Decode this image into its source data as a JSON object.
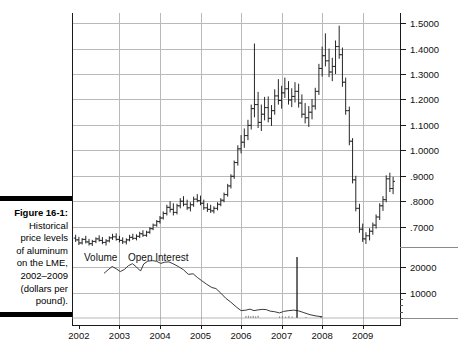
{
  "caption": {
    "figure_label": "Figure 16-1:",
    "lines": [
      "Historical",
      "price levels",
      "of aluminum",
      "on the LME,",
      "2002–2009",
      "(dollars per",
      "pound)."
    ]
  },
  "series_labels": {
    "volume": "Volume",
    "open_interest": "Open Interest"
  },
  "colors": {
    "bars": "#1a1a1a",
    "grid": "#b9b9b9",
    "axis": "#1a1a1a",
    "line": "#3a3a3a"
  },
  "chart_data": {
    "type": "line",
    "subtype": "ohlc-bar-chart-with-volume-panel",
    "xlabel": "",
    "ylabel": "dollars per pound",
    "grid": true,
    "legend_position": "inline-above-volume-panel",
    "price_panel": {
      "ylim": [
        0.62,
        1.54
      ],
      "yticks": [
        1.5,
        1.4,
        1.3,
        1.2,
        1.1,
        1.0,
        0.9,
        0.8,
        0.7
      ],
      "ytick_labels": [
        "1.5000",
        "1.4000",
        "1.3000",
        "1.2000",
        "1.1000",
        "1.0000",
        ".9000",
        ".8000",
        ".7000"
      ]
    },
    "volume_panel": {
      "ylim": [
        0,
        26000
      ],
      "yticks": [
        20000,
        10000
      ],
      "ytick_labels": [
        "20000",
        "10000"
      ]
    },
    "xticks": [
      2002,
      2003,
      2004,
      2005,
      2006,
      2007,
      2008,
      2009
    ],
    "xtick_labels": [
      "2002",
      "2003",
      "2004",
      "2005",
      "2006",
      "2007",
      "2008",
      "2009"
    ],
    "xlim": [
      2001.83,
      2009.92
    ],
    "ohlc": [
      {
        "t": 2001.92,
        "o": 0.655,
        "h": 0.668,
        "l": 0.64,
        "c": 0.648
      },
      {
        "t": 2002.0,
        "o": 0.648,
        "h": 0.66,
        "l": 0.628,
        "c": 0.636
      },
      {
        "t": 2002.08,
        "o": 0.636,
        "h": 0.655,
        "l": 0.63,
        "c": 0.65
      },
      {
        "t": 2002.17,
        "o": 0.65,
        "h": 0.664,
        "l": 0.634,
        "c": 0.64
      },
      {
        "t": 2002.25,
        "o": 0.64,
        "h": 0.652,
        "l": 0.626,
        "c": 0.633
      },
      {
        "t": 2002.33,
        "o": 0.633,
        "h": 0.648,
        "l": 0.624,
        "c": 0.642
      },
      {
        "t": 2002.42,
        "o": 0.642,
        "h": 0.658,
        "l": 0.635,
        "c": 0.652
      },
      {
        "t": 2002.5,
        "o": 0.652,
        "h": 0.666,
        "l": 0.641,
        "c": 0.646
      },
      {
        "t": 2002.58,
        "o": 0.646,
        "h": 0.659,
        "l": 0.631,
        "c": 0.638
      },
      {
        "t": 2002.67,
        "o": 0.638,
        "h": 0.651,
        "l": 0.626,
        "c": 0.644
      },
      {
        "t": 2002.75,
        "o": 0.644,
        "h": 0.662,
        "l": 0.638,
        "c": 0.656
      },
      {
        "t": 2002.83,
        "o": 0.656,
        "h": 0.672,
        "l": 0.648,
        "c": 0.66
      },
      {
        "t": 2002.92,
        "o": 0.66,
        "h": 0.674,
        "l": 0.645,
        "c": 0.65
      },
      {
        "t": 2003.0,
        "o": 0.65,
        "h": 0.664,
        "l": 0.638,
        "c": 0.646
      },
      {
        "t": 2003.08,
        "o": 0.646,
        "h": 0.658,
        "l": 0.632,
        "c": 0.64
      },
      {
        "t": 2003.17,
        "o": 0.64,
        "h": 0.654,
        "l": 0.63,
        "c": 0.648
      },
      {
        "t": 2003.25,
        "o": 0.648,
        "h": 0.668,
        "l": 0.642,
        "c": 0.658
      },
      {
        "t": 2003.33,
        "o": 0.658,
        "h": 0.672,
        "l": 0.648,
        "c": 0.654
      },
      {
        "t": 2003.42,
        "o": 0.654,
        "h": 0.67,
        "l": 0.646,
        "c": 0.662
      },
      {
        "t": 2003.5,
        "o": 0.662,
        "h": 0.68,
        "l": 0.655,
        "c": 0.672
      },
      {
        "t": 2003.58,
        "o": 0.672,
        "h": 0.686,
        "l": 0.66,
        "c": 0.666
      },
      {
        "t": 2003.67,
        "o": 0.666,
        "h": 0.684,
        "l": 0.66,
        "c": 0.678
      },
      {
        "t": 2003.75,
        "o": 0.678,
        "h": 0.698,
        "l": 0.672,
        "c": 0.692
      },
      {
        "t": 2003.83,
        "o": 0.692,
        "h": 0.712,
        "l": 0.686,
        "c": 0.706
      },
      {
        "t": 2003.92,
        "o": 0.706,
        "h": 0.726,
        "l": 0.7,
        "c": 0.72
      },
      {
        "t": 2004.0,
        "o": 0.72,
        "h": 0.742,
        "l": 0.712,
        "c": 0.734
      },
      {
        "t": 2004.08,
        "o": 0.734,
        "h": 0.76,
        "l": 0.728,
        "c": 0.752
      },
      {
        "t": 2004.17,
        "o": 0.752,
        "h": 0.786,
        "l": 0.744,
        "c": 0.776
      },
      {
        "t": 2004.25,
        "o": 0.776,
        "h": 0.8,
        "l": 0.756,
        "c": 0.768
      },
      {
        "t": 2004.33,
        "o": 0.768,
        "h": 0.792,
        "l": 0.744,
        "c": 0.756
      },
      {
        "t": 2004.42,
        "o": 0.756,
        "h": 0.79,
        "l": 0.748,
        "c": 0.782
      },
      {
        "t": 2004.5,
        "o": 0.782,
        "h": 0.812,
        "l": 0.772,
        "c": 0.8
      },
      {
        "t": 2004.58,
        "o": 0.8,
        "h": 0.82,
        "l": 0.78,
        "c": 0.788
      },
      {
        "t": 2004.67,
        "o": 0.788,
        "h": 0.806,
        "l": 0.766,
        "c": 0.774
      },
      {
        "t": 2004.75,
        "o": 0.774,
        "h": 0.796,
        "l": 0.76,
        "c": 0.786
      },
      {
        "t": 2004.83,
        "o": 0.786,
        "h": 0.818,
        "l": 0.778,
        "c": 0.808
      },
      {
        "t": 2004.92,
        "o": 0.808,
        "h": 0.828,
        "l": 0.796,
        "c": 0.802
      },
      {
        "t": 2005.0,
        "o": 0.802,
        "h": 0.822,
        "l": 0.784,
        "c": 0.792
      },
      {
        "t": 2005.08,
        "o": 0.792,
        "h": 0.806,
        "l": 0.766,
        "c": 0.774
      },
      {
        "t": 2005.17,
        "o": 0.774,
        "h": 0.792,
        "l": 0.758,
        "c": 0.768
      },
      {
        "t": 2005.25,
        "o": 0.768,
        "h": 0.786,
        "l": 0.754,
        "c": 0.762
      },
      {
        "t": 2005.33,
        "o": 0.762,
        "h": 0.78,
        "l": 0.752,
        "c": 0.772
      },
      {
        "t": 2005.42,
        "o": 0.772,
        "h": 0.796,
        "l": 0.764,
        "c": 0.788
      },
      {
        "t": 2005.5,
        "o": 0.788,
        "h": 0.812,
        "l": 0.78,
        "c": 0.804
      },
      {
        "t": 2005.58,
        "o": 0.804,
        "h": 0.834,
        "l": 0.796,
        "c": 0.826
      },
      {
        "t": 2005.67,
        "o": 0.826,
        "h": 0.868,
        "l": 0.818,
        "c": 0.86
      },
      {
        "t": 2005.75,
        "o": 0.86,
        "h": 0.906,
        "l": 0.85,
        "c": 0.898
      },
      {
        "t": 2005.83,
        "o": 0.898,
        "h": 0.96,
        "l": 0.888,
        "c": 0.952
      },
      {
        "t": 2005.92,
        "o": 0.952,
        "h": 1.02,
        "l": 0.94,
        "c": 1.006
      },
      {
        "t": 2006.0,
        "o": 1.006,
        "h": 1.06,
        "l": 0.988,
        "c": 1.032
      },
      {
        "t": 2006.08,
        "o": 1.032,
        "h": 1.086,
        "l": 1.01,
        "c": 1.058
      },
      {
        "t": 2006.17,
        "o": 1.058,
        "h": 1.12,
        "l": 1.04,
        "c": 1.098
      },
      {
        "t": 2006.25,
        "o": 1.098,
        "h": 1.18,
        "l": 1.082,
        "c": 1.164
      },
      {
        "t": 2006.33,
        "o": 1.164,
        "h": 1.42,
        "l": 1.13,
        "c": 1.18
      },
      {
        "t": 2006.42,
        "o": 1.18,
        "h": 1.23,
        "l": 1.088,
        "c": 1.11
      },
      {
        "t": 2006.5,
        "o": 1.11,
        "h": 1.18,
        "l": 1.076,
        "c": 1.142
      },
      {
        "t": 2006.58,
        "o": 1.142,
        "h": 1.21,
        "l": 1.118,
        "c": 1.168
      },
      {
        "t": 2006.67,
        "o": 1.168,
        "h": 1.212,
        "l": 1.11,
        "c": 1.126
      },
      {
        "t": 2006.75,
        "o": 1.126,
        "h": 1.178,
        "l": 1.096,
        "c": 1.156
      },
      {
        "t": 2006.83,
        "o": 1.156,
        "h": 1.24,
        "l": 1.14,
        "c": 1.214
      },
      {
        "t": 2006.92,
        "o": 1.214,
        "h": 1.28,
        "l": 1.18,
        "c": 1.196
      },
      {
        "t": 2007.0,
        "o": 1.196,
        "h": 1.254,
        "l": 1.164,
        "c": 1.226
      },
      {
        "t": 2007.08,
        "o": 1.226,
        "h": 1.286,
        "l": 1.206,
        "c": 1.242
      },
      {
        "t": 2007.17,
        "o": 1.242,
        "h": 1.272,
        "l": 1.18,
        "c": 1.198
      },
      {
        "t": 2007.25,
        "o": 1.198,
        "h": 1.244,
        "l": 1.17,
        "c": 1.212
      },
      {
        "t": 2007.33,
        "o": 1.212,
        "h": 1.268,
        "l": 1.188,
        "c": 1.232
      },
      {
        "t": 2007.42,
        "o": 1.232,
        "h": 1.262,
        "l": 1.168,
        "c": 1.186
      },
      {
        "t": 2007.5,
        "o": 1.186,
        "h": 1.22,
        "l": 1.128,
        "c": 1.142
      },
      {
        "t": 2007.58,
        "o": 1.142,
        "h": 1.186,
        "l": 1.106,
        "c": 1.128
      },
      {
        "t": 2007.67,
        "o": 1.128,
        "h": 1.174,
        "l": 1.092,
        "c": 1.15
      },
      {
        "t": 2007.75,
        "o": 1.15,
        "h": 1.202,
        "l": 1.122,
        "c": 1.174
      },
      {
        "t": 2007.83,
        "o": 1.174,
        "h": 1.246,
        "l": 1.16,
        "c": 1.232
      },
      {
        "t": 2007.92,
        "o": 1.232,
        "h": 1.34,
        "l": 1.218,
        "c": 1.322
      },
      {
        "t": 2008.0,
        "o": 1.322,
        "h": 1.408,
        "l": 1.29,
        "c": 1.372
      },
      {
        "t": 2008.08,
        "o": 1.372,
        "h": 1.46,
        "l": 1.33,
        "c": 1.352
      },
      {
        "t": 2008.17,
        "o": 1.352,
        "h": 1.4,
        "l": 1.288,
        "c": 1.308
      },
      {
        "t": 2008.25,
        "o": 1.308,
        "h": 1.364,
        "l": 1.272,
        "c": 1.33
      },
      {
        "t": 2008.33,
        "o": 1.33,
        "h": 1.432,
        "l": 1.3,
        "c": 1.408
      },
      {
        "t": 2008.42,
        "o": 1.408,
        "h": 1.49,
        "l": 1.36,
        "c": 1.376
      },
      {
        "t": 2008.5,
        "o": 1.376,
        "h": 1.404,
        "l": 1.25,
        "c": 1.268
      },
      {
        "t": 2008.58,
        "o": 1.268,
        "h": 1.286,
        "l": 1.14,
        "c": 1.156
      },
      {
        "t": 2008.67,
        "o": 1.156,
        "h": 1.172,
        "l": 1.02,
        "c": 1.036
      },
      {
        "t": 2008.75,
        "o": 1.036,
        "h": 1.048,
        "l": 0.87,
        "c": 0.884
      },
      {
        "t": 2008.83,
        "o": 0.884,
        "h": 0.9,
        "l": 0.76,
        "c": 0.772
      },
      {
        "t": 2008.92,
        "o": 0.772,
        "h": 0.79,
        "l": 0.676,
        "c": 0.69
      },
      {
        "t": 2009.0,
        "o": 0.69,
        "h": 0.712,
        "l": 0.64,
        "c": 0.652
      },
      {
        "t": 2009.08,
        "o": 0.652,
        "h": 0.678,
        "l": 0.632,
        "c": 0.664
      },
      {
        "t": 2009.17,
        "o": 0.664,
        "h": 0.694,
        "l": 0.646,
        "c": 0.682
      },
      {
        "t": 2009.25,
        "o": 0.682,
        "h": 0.716,
        "l": 0.668,
        "c": 0.706
      },
      {
        "t": 2009.33,
        "o": 0.706,
        "h": 0.748,
        "l": 0.692,
        "c": 0.738
      },
      {
        "t": 2009.42,
        "o": 0.738,
        "h": 0.792,
        "l": 0.726,
        "c": 0.782
      },
      {
        "t": 2009.5,
        "o": 0.782,
        "h": 0.82,
        "l": 0.762,
        "c": 0.806
      },
      {
        "t": 2009.58,
        "o": 0.806,
        "h": 0.902,
        "l": 0.796,
        "c": 0.888
      },
      {
        "t": 2009.67,
        "o": 0.888,
        "h": 0.912,
        "l": 0.836,
        "c": 0.85
      },
      {
        "t": 2009.75,
        "o": 0.85,
        "h": 0.896,
        "l": 0.828,
        "c": 0.878
      }
    ],
    "open_interest": [
      {
        "t": 2002.62,
        "v": 17600
      },
      {
        "t": 2002.72,
        "v": 19000
      },
      {
        "t": 2002.82,
        "v": 20300
      },
      {
        "t": 2002.92,
        "v": 19400
      },
      {
        "t": 2003.02,
        "v": 18300
      },
      {
        "t": 2003.12,
        "v": 19100
      },
      {
        "t": 2003.22,
        "v": 20600
      },
      {
        "t": 2003.32,
        "v": 21400
      },
      {
        "t": 2003.42,
        "v": 20100
      },
      {
        "t": 2003.52,
        "v": 18500
      },
      {
        "t": 2003.6,
        "v": 21300
      },
      {
        "t": 2003.7,
        "v": 22400
      },
      {
        "t": 2003.82,
        "v": 22600
      },
      {
        "t": 2003.92,
        "v": 22300
      },
      {
        "t": 2004.02,
        "v": 21500
      },
      {
        "t": 2004.12,
        "v": 22000
      },
      {
        "t": 2004.22,
        "v": 22100
      },
      {
        "t": 2004.32,
        "v": 21400
      },
      {
        "t": 2004.45,
        "v": 20300
      },
      {
        "t": 2004.58,
        "v": 19000
      },
      {
        "t": 2004.7,
        "v": 17200
      },
      {
        "t": 2004.82,
        "v": 17400
      },
      {
        "t": 2004.92,
        "v": 16000
      },
      {
        "t": 2005.02,
        "v": 14800
      },
      {
        "t": 2005.15,
        "v": 13300
      },
      {
        "t": 2005.28,
        "v": 12000
      },
      {
        "t": 2005.38,
        "v": 11600
      },
      {
        "t": 2005.5,
        "v": 9800
      },
      {
        "t": 2005.62,
        "v": 7800
      },
      {
        "t": 2005.75,
        "v": 6200
      },
      {
        "t": 2005.88,
        "v": 4400
      },
      {
        "t": 2006.0,
        "v": 2900
      },
      {
        "t": 2006.12,
        "v": 3100
      },
      {
        "t": 2006.22,
        "v": 3500
      },
      {
        "t": 2006.32,
        "v": 2900
      },
      {
        "t": 2006.42,
        "v": 3200
      },
      {
        "t": 2006.52,
        "v": 3400
      },
      {
        "t": 2006.62,
        "v": 3300
      },
      {
        "t": 2006.72,
        "v": 2700
      },
      {
        "t": 2006.82,
        "v": 2500
      },
      {
        "t": 2006.95,
        "v": 2000
      },
      {
        "t": 2007.05,
        "v": 2600
      },
      {
        "t": 2007.18,
        "v": 2900
      },
      {
        "t": 2007.3,
        "v": 3100
      },
      {
        "t": 2007.42,
        "v": 2800
      },
      {
        "t": 2007.55,
        "v": 2100
      },
      {
        "t": 2007.7,
        "v": 1300
      },
      {
        "t": 2007.85,
        "v": 800
      },
      {
        "t": 2008.0,
        "v": 500
      }
    ],
    "volume_spike": {
      "t": 2007.38,
      "v": 24000
    },
    "volume_bars": [
      {
        "t": 2006.12,
        "v": 800
      },
      {
        "t": 2006.18,
        "v": 900
      },
      {
        "t": 2006.24,
        "v": 700
      },
      {
        "t": 2006.3,
        "v": 850
      },
      {
        "t": 2006.36,
        "v": 650
      },
      {
        "t": 2006.42,
        "v": 900
      },
      {
        "t": 2006.95,
        "v": 600
      },
      {
        "t": 2007.02,
        "v": 700
      },
      {
        "t": 2007.1,
        "v": 550
      },
      {
        "t": 2007.18,
        "v": 800
      },
      {
        "t": 2007.26,
        "v": 600
      },
      {
        "t": 2007.6,
        "v": 400
      }
    ]
  }
}
